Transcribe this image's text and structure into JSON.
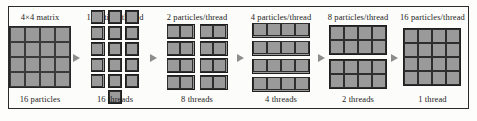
{
  "figure": {
    "colors": {
      "cell_fill": "#9a9a9a",
      "cell_border": "#262626",
      "frame_border": "#2b2b2b",
      "arrow": "#8d8d8d",
      "background": "#fdfdfb",
      "text": "#1c1c1c"
    }
  },
  "stages": [
    {
      "top_label": "4×4 matrix",
      "bottom_label": "16 particles",
      "blocks": 1,
      "cells_per_block": 16,
      "block_cols": 4,
      "block_rows": 4,
      "contiguous": true
    },
    {
      "top_label": "1 particle/thread",
      "bottom_label": "16 threads",
      "blocks": 16,
      "cells_per_block": 1,
      "block_cols": 1,
      "block_rows": 1,
      "contiguous": false
    },
    {
      "top_label": "2 particles/thread",
      "bottom_label": "8 threads",
      "blocks": 8,
      "cells_per_block": 2,
      "block_cols": 2,
      "block_rows": 1,
      "contiguous": false
    },
    {
      "top_label": "4 particles/thread",
      "bottom_label": "4 threads",
      "blocks": 4,
      "cells_per_block": 4,
      "block_cols": 4,
      "block_rows": 1,
      "contiguous": false
    },
    {
      "top_label": "8 particles/thread",
      "bottom_label": "2 threads",
      "blocks": 2,
      "cells_per_block": 8,
      "block_cols": 4,
      "block_rows": 2,
      "contiguous": false
    },
    {
      "top_label": "16 particles/thread",
      "bottom_label": "1 thread",
      "blocks": 1,
      "cells_per_block": 16,
      "block_cols": 4,
      "block_rows": 4,
      "contiguous": false
    }
  ],
  "arrows": {
    "count": 5,
    "glyph": "right-triangle-arrow"
  }
}
